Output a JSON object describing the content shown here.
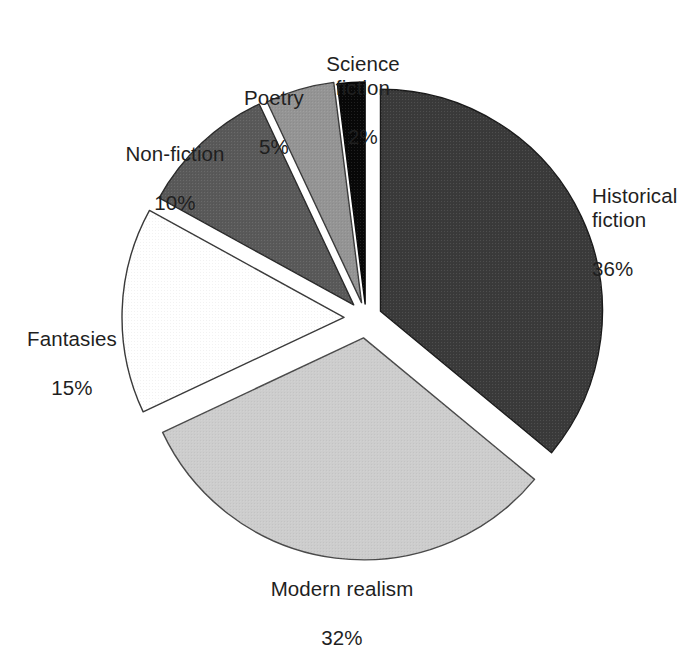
{
  "chart_data": {
    "type": "pie",
    "title": "",
    "subtitle": "",
    "xlabel": "",
    "ylabel": "",
    "legend_position": "none",
    "grid": false,
    "units": "percent",
    "total": 100,
    "start_angle_deg": 0,
    "direction": "clockwise",
    "exploded": true,
    "categories": [
      "Historical fiction",
      "Modern realism",
      "Fantasies",
      "Non-fiction",
      "Poetry",
      "Science fiction"
    ],
    "values": [
      36,
      32,
      15,
      10,
      5,
      2
    ],
    "slices": [
      {
        "label": "Historical fiction",
        "label_lines": [
          "Historical",
          "fiction"
        ],
        "value": 36,
        "value_text": "36%",
        "color": "#3a3a3a",
        "stroke": "#1a1a1a",
        "start_deg": 0,
        "end_deg": 129.6,
        "mid_deg": 64.8,
        "explode": 16
      },
      {
        "label": "Modern realism",
        "label_lines": [
          "Modern realism"
        ],
        "value": 32,
        "value_text": "32%",
        "color": "#cdcdcd",
        "stroke": "#4a4a4a",
        "start_deg": 129.6,
        "end_deg": 244.8,
        "mid_deg": 187.2,
        "explode": 20
      },
      {
        "label": "Fantasies",
        "label_lines": [
          "Fantasies"
        ],
        "value": 15,
        "value_text": "15%",
        "color": "#ffffff",
        "stroke": "#3a3a3a",
        "start_deg": 244.8,
        "end_deg": 298.8,
        "mid_deg": 271.8,
        "explode": 22
      },
      {
        "label": "Non-fiction",
        "label_lines": [
          "Non-fiction"
        ],
        "value": 10,
        "value_text": "10%",
        "color": "#595959",
        "stroke": "#2a2a2a",
        "start_deg": 298.8,
        "end_deg": 334.8,
        "mid_deg": 316.8,
        "explode": 18
      },
      {
        "label": "Poetry",
        "label_lines": [
          "Poetry"
        ],
        "value": 5,
        "value_text": "5%",
        "color": "#949494",
        "stroke": "#3a3a3a",
        "start_deg": 334.8,
        "end_deg": 352.8,
        "mid_deg": 343.8,
        "explode": 16
      },
      {
        "label": "Science fiction",
        "label_lines": [
          "Science",
          "fiction"
        ],
        "value": 2,
        "value_text": "2%",
        "color": "#080808",
        "stroke": "#080808",
        "start_deg": 352.8,
        "end_deg": 360,
        "mid_deg": 356.4,
        "explode": 14
      }
    ]
  },
  "labels": {
    "historical_fiction": {
      "name": "Historical\nfiction",
      "value": "36%"
    },
    "modern_realism": {
      "name": "Modern realism",
      "value": "32%"
    },
    "fantasies": {
      "name": "Fantasies",
      "value": "15%"
    },
    "non_fiction": {
      "name": "Non-fiction",
      "value": "10%"
    },
    "poetry": {
      "name": "Poetry",
      "value": "5%"
    },
    "science_fiction": {
      "name": "Science\nfiction",
      "value": "2%"
    }
  },
  "geometry": {
    "center_x": 366,
    "center_y": 318,
    "radius": 222
  },
  "colors": {
    "background": "#ffffff",
    "text": "#1f1f1f",
    "historical_fiction": "#3a3a3a",
    "modern_realism": "#cdcdcd",
    "fantasies": "#ffffff",
    "non_fiction": "#595959",
    "poetry": "#949494",
    "science_fiction": "#080808"
  }
}
